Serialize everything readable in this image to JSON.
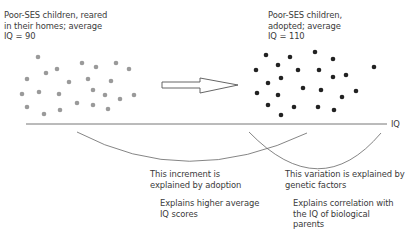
{
  "left_group": {
    "lines": [
      "Poor-SES children, reared",
      "in their homes; average",
      "IQ = 90"
    ],
    "dot_color": "#9a9a9a",
    "dots": [
      [
        38,
        57
      ],
      [
        82,
        63
      ],
      [
        96,
        67
      ],
      [
        116,
        63
      ],
      [
        129,
        69
      ],
      [
        46,
        73
      ],
      [
        57,
        69
      ],
      [
        27,
        79
      ],
      [
        69,
        82
      ],
      [
        88,
        79
      ],
      [
        111,
        81
      ],
      [
        22,
        94
      ],
      [
        39,
        92
      ],
      [
        59,
        94
      ],
      [
        93,
        90
      ],
      [
        105,
        95
      ],
      [
        120,
        99
      ],
      [
        134,
        95
      ],
      [
        27,
        107
      ],
      [
        44,
        114
      ],
      [
        60,
        110
      ],
      [
        77,
        103
      ],
      [
        93,
        105
      ],
      [
        108,
        109
      ]
    ]
  },
  "right_group": {
    "lines": [
      "Poor-SES children,",
      "adopted; average",
      "IQ = 110"
    ],
    "dot_color": "#222222",
    "dots": [
      [
        266,
        55
      ],
      [
        290,
        57
      ],
      [
        315,
        52
      ],
      [
        333,
        59
      ],
      [
        278,
        65
      ],
      [
        256,
        70
      ],
      [
        298,
        70
      ],
      [
        319,
        70
      ],
      [
        333,
        77
      ],
      [
        346,
        75
      ],
      [
        374,
        67
      ],
      [
        268,
        83
      ],
      [
        281,
        78
      ],
      [
        303,
        88
      ],
      [
        321,
        90
      ],
      [
        356,
        91
      ],
      [
        342,
        97
      ],
      [
        257,
        93
      ],
      [
        278,
        95
      ],
      [
        268,
        105
      ],
      [
        294,
        107
      ],
      [
        318,
        107
      ],
      [
        334,
        110
      ],
      [
        281,
        115
      ]
    ]
  },
  "axis": {
    "label": "IQ"
  },
  "annotations": {
    "increment": {
      "lines": [
        "This increment is",
        "explained by adoption"
      ],
      "sub_lines": [
        "Explains higher average",
        "IQ scores"
      ]
    },
    "variation": {
      "lines": [
        "This variation is explained by",
        "genetic factors"
      ],
      "sub_lines": [
        "Explains correlation with",
        "the IQ of biological",
        "parents"
      ]
    }
  }
}
